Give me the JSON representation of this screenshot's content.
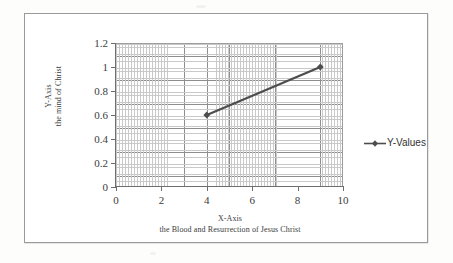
{
  "chart_data": {
    "type": "line",
    "title": "",
    "xlabel": "X-Axis",
    "xlabel_sub": "the Blood and Resurrection of Jesus Christ",
    "ylabel": "Y-Axis",
    "ylabel_sub": "the mind of Christ",
    "xlim": [
      0,
      10
    ],
    "ylim": [
      0,
      1.2
    ],
    "x_ticks": [
      "0",
      "2",
      "4",
      "6",
      "8",
      "10"
    ],
    "x_tick_values": [
      0,
      2,
      4,
      6,
      8,
      10
    ],
    "y_ticks": [
      "0",
      "0.2",
      "0.4",
      "0.6",
      "0.8",
      "1",
      "1.2"
    ],
    "y_tick_values": [
      0,
      0.2,
      0.4,
      0.6,
      0.8,
      1,
      1.2
    ],
    "grid": true,
    "minor_grid": true,
    "legend_position": "right",
    "series": [
      {
        "name": "Y-Values",
        "color": "#4d4d4d",
        "marker": "diamond",
        "x": [
          4,
          9
        ],
        "values": [
          0.6,
          1.0
        ],
        "points": [
          {
            "x": 4,
            "y": 0.6
          },
          {
            "x": 9,
            "y": 1.0
          }
        ]
      }
    ]
  },
  "legend": {
    "items": [
      {
        "label": "Y-Values",
        "color": "#4d4d4d"
      }
    ]
  },
  "colors": {
    "series": "#4d4d4d",
    "major_grid": "#8e8e8e",
    "minor_grid": "#c9c9c9",
    "axis": "#6e6e6e",
    "frame": "#9a9a9a",
    "text": "#3b3b3b",
    "background": "#ffffff"
  }
}
